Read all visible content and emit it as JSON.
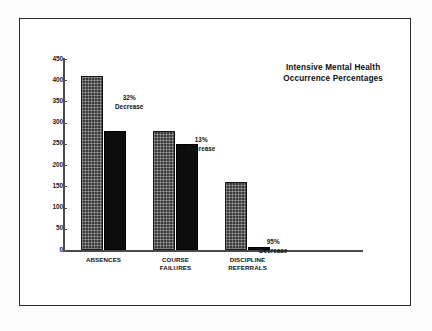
{
  "chart_data": {
    "type": "bar",
    "title": "Intensive Mental Health Occurrence Percentages",
    "title_line1": "Intensive Mental Health",
    "title_line2": "Occurrence Percentages",
    "xlabel": "",
    "ylabel": "",
    "ylim": [
      0,
      450
    ],
    "yticks": [
      0,
      50,
      100,
      150,
      200,
      250,
      300,
      350,
      400,
      450
    ],
    "ytick_labels": [
      "0",
      "50",
      "100",
      "150",
      "200",
      "250",
      "300",
      "350",
      "400",
      "450"
    ],
    "grid": false,
    "legend": "none",
    "categories": [
      "ABSENCES",
      "COURSE FAILURES",
      "DISCIPLINE REFERRALS"
    ],
    "category_lines": [
      [
        "ABSENCES"
      ],
      [
        "COURSE",
        "FAILURES"
      ],
      [
        "DISCIPLINE",
        "REFERRALS"
      ]
    ],
    "series": [
      {
        "name": "Before",
        "style": "patterned",
        "color": "#3a3a3a",
        "values": [
          410,
          280,
          160
        ]
      },
      {
        "name": "After",
        "style": "solid",
        "color": "#0d0d0d",
        "values": [
          280,
          250,
          8
        ]
      }
    ],
    "annotations": [
      {
        "percent": "32%",
        "label": "Decrease",
        "category": "ABSENCES"
      },
      {
        "percent": "13%",
        "label": "Decrease",
        "category": "COURSE FAILURES"
      },
      {
        "percent": "95%",
        "label": "Decrease",
        "category": "DISCIPLINE REFERRALS"
      }
    ]
  },
  "colors": {
    "frame": "#2b2b2b",
    "axis": "#4a4a4a",
    "background": "#ffffff",
    "bar_patterned": "#3a3a3a",
    "bar_solid": "#0d0d0d",
    "text": "#121212"
  }
}
